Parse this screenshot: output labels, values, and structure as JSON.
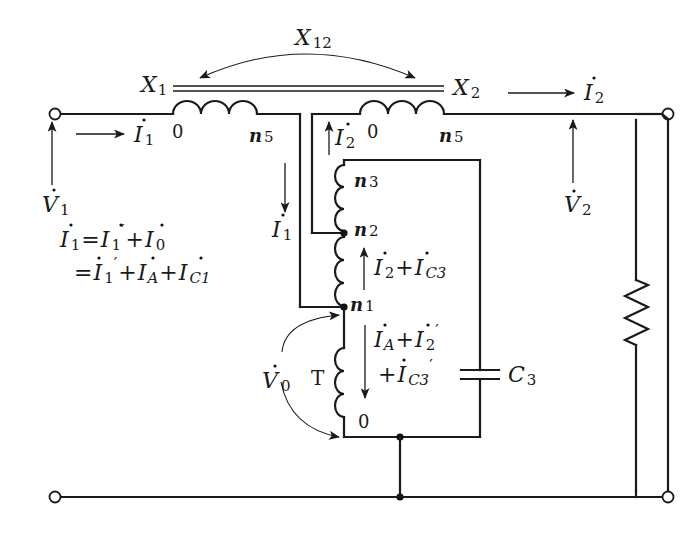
{
  "diagram": {
    "reactances": {
      "x1": "X",
      "x1_sub": "1",
      "x2": "X",
      "x2_sub": "2",
      "x12": "X",
      "x12_sub": "12"
    },
    "primary_winding": {
      "start_tap": "0",
      "end_tap": "n",
      "end_tap_sub": "5"
    },
    "secondary_winding": {
      "start_tap": "0",
      "end_tap": "n",
      "end_tap_sub": "5"
    },
    "tapped_winding": {
      "taps": [
        {
          "label": "n",
          "sub": "3"
        },
        {
          "label": "n",
          "sub": "2"
        },
        {
          "label": "n",
          "sub": "1"
        },
        {
          "label": "0",
          "sub": ""
        }
      ],
      "core_label": "T"
    },
    "capacitor": {
      "label": "C",
      "sub": "3"
    },
    "voltages": {
      "v1": {
        "label": "V",
        "sub": "1"
      },
      "v2": {
        "label": "V",
        "sub": "2"
      },
      "v0": {
        "label": "V",
        "sub": "0"
      }
    },
    "currents": {
      "i1_input": {
        "label": "I",
        "sub": "1"
      },
      "i1_branch": {
        "label": "I",
        "sub": "1"
      },
      "i2_output": {
        "label": "I",
        "sub": "2"
      },
      "i2_tap": {
        "label": "I",
        "sub": "2"
      },
      "i2_plus_ic3": {
        "a": "I",
        "a_sub": "2",
        "op": "+",
        "b": "I",
        "b_sub": "C3"
      },
      "ia_plus_i2p": {
        "a": "I",
        "a_sub": "A",
        "op": "+",
        "b": "I",
        "b_sub": "2",
        "b_prime": "′"
      },
      "plus_ic3p": {
        "op": "+",
        "b": "I",
        "b_sub": "C3",
        "b_prime": "′"
      }
    },
    "equations": {
      "line1": {
        "lhs": "I",
        "lhs_sub": "1",
        "eq": "=",
        "t1": "I",
        "t1_sub": "1",
        "t1_prime": "′",
        "op": "+",
        "t2": "I",
        "t2_sub": "0"
      },
      "line2": {
        "eq": "=",
        "t1": "I",
        "t1_sub": "1",
        "t1_prime": "′",
        "op1": "+",
        "t2": "I",
        "t2_sub": "A",
        "op2": "+",
        "t3": "I",
        "t3_sub": "C1"
      }
    },
    "colors": {
      "ink": "#1a1a1a",
      "background": "#ffffff"
    }
  }
}
